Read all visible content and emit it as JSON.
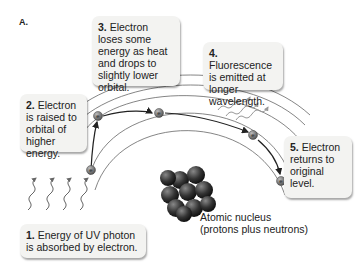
{
  "panel": {
    "label": "A."
  },
  "steps": [
    {
      "number": "1.",
      "text": "Energy of UV photon is absorbed by electron."
    },
    {
      "number": "2.",
      "text": "Electron is raised to orbital of higher energy."
    },
    {
      "number": "3.",
      "text": "Electron loses some energy as heat and drops to slightly lower orbital."
    },
    {
      "number": "4.",
      "text": "Fluorescence is emitted at longer wavelength."
    },
    {
      "number": "5.",
      "text": "Electron returns to original level."
    }
  ],
  "nucleus": {
    "label_line1": "Atomic nucleus",
    "label_line2": "(protons plus neutrons)"
  },
  "electron_symbol": "e",
  "colors": {
    "box_bg": "#f3f3f1",
    "orbit": "#555555",
    "arrow": "#222222",
    "nucleus": "#3a3a3a",
    "photon": "#666666",
    "emission": "#999999"
  }
}
